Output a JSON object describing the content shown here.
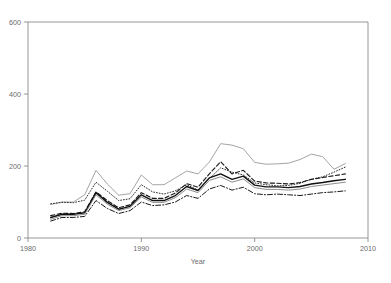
{
  "chart_data": {
    "type": "line",
    "title": "",
    "xlabel": "Year",
    "ylabel": "",
    "xlim": [
      1980,
      2010
    ],
    "ylim": [
      0,
      600
    ],
    "xticks": [
      1980,
      1990,
      2000,
      2010
    ],
    "yticks": [
      0,
      200,
      400,
      600
    ],
    "xtick_labels": [
      "1980",
      "1990",
      "2000",
      "2010"
    ],
    "ytick_labels": [
      "0",
      "200",
      "400",
      "600"
    ],
    "grid": false,
    "legend": "none",
    "x": [
      1982,
      1983,
      1984,
      1985,
      1986,
      1987,
      1988,
      1989,
      1990,
      1991,
      1992,
      1993,
      1994,
      1995,
      1996,
      1997,
      1998,
      1999,
      2000,
      2001,
      2002,
      2003,
      2004,
      2005,
      2006,
      2007,
      2008
    ],
    "series": [
      {
        "name": "series-gray-solid",
        "style": "solid",
        "color": "#9a9a9a",
        "width": 0.9,
        "values": [
          93,
          100,
          100,
          120,
          188,
          150,
          119,
          123,
          175,
          148,
          148,
          167,
          186,
          178,
          211,
          262,
          258,
          248,
          210,
          205,
          206,
          208,
          218,
          233,
          226,
          191,
          207
        ]
      },
      {
        "name": "series-dotted",
        "style": "dotted",
        "color": "#2b2b2b",
        "width": 1.0,
        "values": [
          95,
          99,
          98,
          105,
          155,
          130,
          104,
          109,
          148,
          128,
          122,
          131,
          148,
          133,
          165,
          195,
          183,
          175,
          153,
          148,
          145,
          146,
          152,
          163,
          170,
          183,
          197
        ]
      },
      {
        "name": "series-dashed",
        "style": "dashed",
        "color": "#1a1a1a",
        "width": 1.15,
        "values": [
          62,
          69,
          68,
          73,
          128,
          104,
          84,
          92,
          126,
          110,
          110,
          125,
          151,
          141,
          178,
          212,
          178,
          188,
          158,
          153,
          152,
          150,
          154,
          163,
          168,
          173,
          178
        ]
      },
      {
        "name": "series-black-solid",
        "style": "solid",
        "color": "#111111",
        "width": 1.4,
        "values": [
          57,
          66,
          66,
          70,
          126,
          99,
          80,
          88,
          120,
          104,
          104,
          118,
          143,
          132,
          167,
          178,
          163,
          172,
          147,
          142,
          142,
          140,
          143,
          150,
          154,
          159,
          163
        ]
      },
      {
        "name": "series-gray-thin-solid",
        "style": "solid",
        "color": "#808080",
        "width": 0.9,
        "values": [
          52,
          62,
          62,
          66,
          120,
          94,
          76,
          84,
          114,
          99,
          99,
          112,
          136,
          126,
          160,
          170,
          155,
          164,
          140,
          135,
          135,
          133,
          136,
          143,
          147,
          151,
          155
        ]
      },
      {
        "name": "series-dashdot",
        "style": "dashdot",
        "color": "#1a1a1a",
        "width": 1.0,
        "values": [
          47,
          57,
          57,
          60,
          104,
          82,
          68,
          76,
          100,
          90,
          92,
          100,
          118,
          110,
          136,
          146,
          133,
          141,
          123,
          120,
          122,
          120,
          118,
          122,
          126,
          128,
          131
        ]
      }
    ]
  },
  "axes": {
    "x_axis_label": "Year"
  }
}
